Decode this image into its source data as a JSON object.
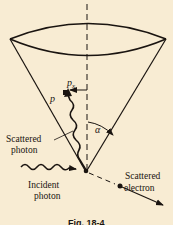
{
  "figure": {
    "caption": "Fig. 18-4",
    "colors": {
      "background": "#f8ecd3",
      "ink": "#1a1410"
    }
  },
  "labels": {
    "px": "p",
    "px_sub": "x",
    "p": "p",
    "alpha": "α",
    "scattered_photon": [
      "Scattered",
      "photon"
    ],
    "incident_photon": [
      "Incident",
      "photon"
    ],
    "scattered_electron": [
      "Scattered",
      "electron"
    ]
  },
  "elements": {
    "cone": "cone-of-scattered-photon-directions",
    "axis": "dashed-vertical-axis",
    "incident_photon": "wavy-arrow-incident-photon",
    "scattered_photon": "wavy-arrow-scattered-photon",
    "momentum_component": "p_x-arrow",
    "angle": "alpha-arc",
    "electron": "scattered-electron-arrow"
  }
}
